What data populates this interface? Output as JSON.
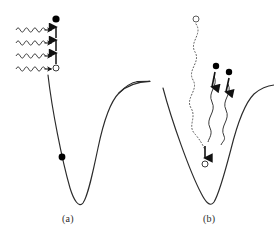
{
  "figure": {
    "type": "scientific-diagram",
    "background_color": "#ffffff",
    "line_color": "#2b2b2b",
    "marker_filled_color": "#000000",
    "marker_open_fill": "#ffffff",
    "marker_open_stroke": "#3a3a3a",
    "width": 274,
    "height": 237
  },
  "panels": [
    {
      "id": "a",
      "label": "(a)",
      "label_x": 62,
      "label_y": 213,
      "curve": {
        "name": "morse-potential-curve-a",
        "left_wall_top": [
          48,
          75
        ],
        "minimum": [
          77,
          205
        ],
        "right_asymptote_y": 82,
        "right_edge_x": 137
      },
      "markers": [
        {
          "name": "excited-state-filled-circle",
          "style": "filled",
          "x": 56,
          "y": 19,
          "r": 3.6
        },
        {
          "name": "ground-state-open-circle",
          "style": "open",
          "x": 56,
          "y": 68,
          "r": 3.0
        },
        {
          "name": "bound-state-filled-circle",
          "style": "filled",
          "x": 62,
          "y": 157,
          "r": 3.4
        }
      ],
      "photon_arrows": {
        "name": "wavy-photon-arrow-group",
        "count": 4,
        "description": "Horizontal sinusoidal photon arrows pointing right toward the vertical transition ladder",
        "rows_y": [
          30,
          43,
          56,
          69
        ],
        "start_x": 16,
        "end_x": 50,
        "amplitude": 4.0,
        "cycles": 4
      },
      "transition_ladder": {
        "name": "vertical-transition-arrow-ladder",
        "description": "Stacked upward transition arrows between ground and excited state",
        "x": 56,
        "segments": [
          {
            "from_y": 64,
            "to_y": 53
          },
          {
            "from_y": 51,
            "to_y": 40
          },
          {
            "from_y": 38,
            "to_y": 27
          },
          {
            "from_y": 25,
            "to_y": 24
          }
        ]
      }
    },
    {
      "id": "b",
      "label": "(b)",
      "label_x": 203,
      "label_y": 213,
      "curve": {
        "name": "morse-potential-curve-b",
        "left_wall_top": [
          163,
          88
        ],
        "minimum": [
          210,
          205
        ],
        "right_asymptote_y": 85,
        "right_edge_x": 274
      },
      "markers": [
        {
          "name": "dissociation-open-circle",
          "style": "open",
          "x": 196,
          "y": 19,
          "r": 3.0
        },
        {
          "name": "emitted-particle-filled-circle-left",
          "style": "filled",
          "x": 216,
          "y": 66,
          "r": 3.2
        },
        {
          "name": "emitted-particle-filled-circle-right",
          "style": "filled",
          "x": 229,
          "y": 72,
          "r": 3.2
        },
        {
          "name": "relaxed-state-open-circle",
          "style": "open",
          "x": 205,
          "y": 164,
          "r": 3.0
        }
      ],
      "dotted_path": {
        "name": "dotted-wavy-trajectory",
        "description": "Dotted sinuous trajectory from the open circle at top descending into the potential well",
        "top": [
          196,
          24
        ],
        "bottom": [
          205,
          150
        ],
        "style": "dotted",
        "amplitude": 7.0
      },
      "descent_arrow": {
        "name": "downward-relaxation-arrow",
        "from_y": 146,
        "to_y": 158,
        "x": 205
      },
      "wavy_tails": [
        {
          "name": "wavy-photon-tail-left",
          "top": [
            216,
            74
          ],
          "bottom": [
            208,
            138
          ],
          "amplitude": 4.5
        },
        {
          "name": "wavy-photon-tail-right",
          "top": [
            229,
            80
          ],
          "bottom": [
            221,
            140
          ],
          "amplitude": 4.0
        }
      ],
      "short_arrows": [
        {
          "name": "short-downward-arrow-left",
          "x": 214,
          "from_y": 74,
          "to_y": 88
        },
        {
          "name": "short-downward-arrow-right",
          "x": 228,
          "from_y": 80,
          "to_y": 92
        }
      ]
    }
  ]
}
